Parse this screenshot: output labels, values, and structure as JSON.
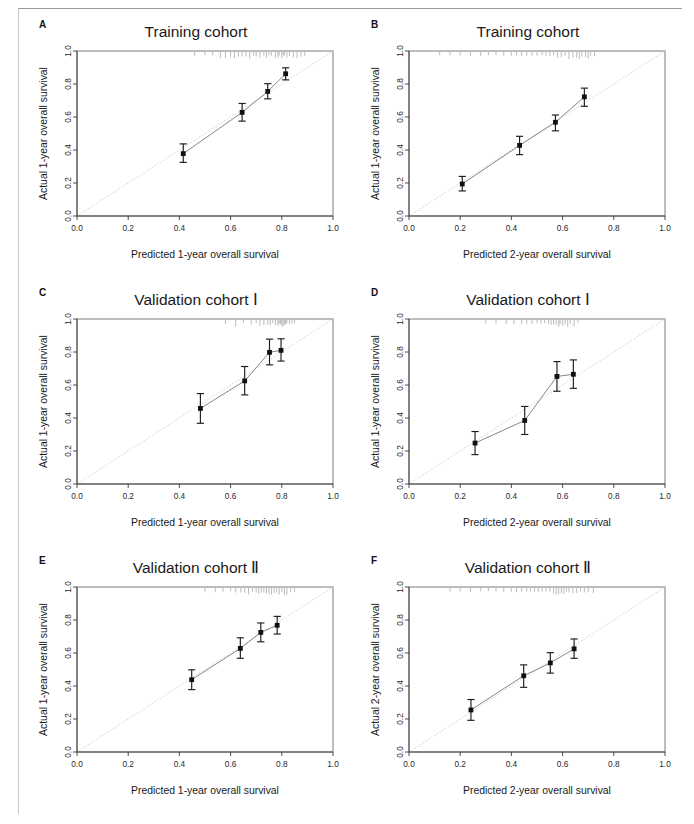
{
  "figure": {
    "panel_count": 6,
    "axis_tick_labels": [
      "0.0",
      "0.2",
      "0.4",
      "0.6",
      "0.8",
      "1.0"
    ],
    "axis_tick_values": [
      0.0,
      0.2,
      0.4,
      0.6,
      0.8,
      1.0
    ],
    "colors": {
      "background": "#ffffff",
      "point": "#101010",
      "error_bar": "#1c1c1c",
      "calibration_line": "#707070",
      "diagonal_reference": "#c4c4c4",
      "axis": "#3a3a3a",
      "box": "#6d6d6d",
      "rug": "#8c8c8c"
    }
  },
  "chart_data": [
    {
      "panel": "A",
      "type": "scatter",
      "title": "Training cohort",
      "xlabel": "Predicted 1-year overall survival",
      "ylabel": "Actual 1-year overall survival",
      "xlim": [
        0,
        1
      ],
      "ylim": [
        0,
        1
      ],
      "grid": false,
      "legend": "none",
      "reference_line": "diagonal y=x",
      "x": [
        0.415,
        0.645,
        0.745,
        0.815
      ],
      "y": [
        0.378,
        0.628,
        0.755,
        0.862
      ],
      "y_lower": [
        0.325,
        0.575,
        0.71,
        0.825
      ],
      "y_upper": [
        0.437,
        0.682,
        0.802,
        0.898
      ],
      "rug_ticks": [
        0.46,
        0.5,
        0.53,
        0.56,
        0.58,
        0.6,
        0.615,
        0.63,
        0.645,
        0.66,
        0.675,
        0.69,
        0.7,
        0.715,
        0.73,
        0.74,
        0.75,
        0.76,
        0.775,
        0.785,
        0.79,
        0.8,
        0.805,
        0.81,
        0.82,
        0.83,
        0.845,
        0.86,
        0.875,
        0.89
      ]
    },
    {
      "panel": "B",
      "type": "scatter",
      "title": "Training cohort",
      "xlabel": "Predicted 2-year overall survival",
      "ylabel": "Actual 1-year overall survival",
      "xlim": [
        0,
        1
      ],
      "ylim": [
        0,
        1
      ],
      "grid": false,
      "legend": "none",
      "reference_line": "diagonal y=x",
      "x": [
        0.208,
        0.432,
        0.572,
        0.685
      ],
      "y": [
        0.194,
        0.428,
        0.568,
        0.722
      ],
      "y_lower": [
        0.152,
        0.372,
        0.516,
        0.665
      ],
      "y_upper": [
        0.24,
        0.483,
        0.612,
        0.775
      ],
      "rug_ticks": [
        0.12,
        0.16,
        0.2,
        0.24,
        0.28,
        0.31,
        0.34,
        0.37,
        0.4,
        0.42,
        0.44,
        0.46,
        0.48,
        0.5,
        0.52,
        0.535,
        0.55,
        0.565,
        0.58,
        0.595,
        0.61,
        0.625,
        0.64,
        0.655,
        0.665,
        0.675,
        0.69,
        0.7,
        0.71,
        0.725
      ]
    },
    {
      "panel": "C",
      "type": "scatter",
      "title": "Validation cohort Ⅰ",
      "xlabel": "Predicted 1-year overall survival",
      "ylabel": "Actual 1-year overall survival",
      "xlim": [
        0,
        1
      ],
      "ylim": [
        0,
        1
      ],
      "grid": false,
      "legend": "none",
      "reference_line": "diagonal y=x",
      "x": [
        0.482,
        0.655,
        0.752,
        0.797
      ],
      "y": [
        0.458,
        0.625,
        0.798,
        0.81
      ],
      "y_lower": [
        0.368,
        0.54,
        0.722,
        0.745
      ],
      "y_upper": [
        0.548,
        0.712,
        0.878,
        0.88
      ],
      "rug_ticks": [
        0.58,
        0.62,
        0.65,
        0.68,
        0.7,
        0.715,
        0.73,
        0.745,
        0.755,
        0.765,
        0.775,
        0.785,
        0.79,
        0.795,
        0.8,
        0.805,
        0.81,
        0.815,
        0.82,
        0.83,
        0.84,
        0.85
      ]
    },
    {
      "panel": "D",
      "type": "scatter",
      "title": "Validation cohort Ⅰ",
      "xlabel": "Predicted 2-year overall survival",
      "ylabel": "Actual 1-year overall survival",
      "xlim": [
        0,
        1
      ],
      "ylim": [
        0,
        1
      ],
      "grid": false,
      "legend": "none",
      "reference_line": "diagonal y=x",
      "x": [
        0.258,
        0.452,
        0.578,
        0.642
      ],
      "y": [
        0.248,
        0.385,
        0.652,
        0.665
      ],
      "y_lower": [
        0.178,
        0.3,
        0.562,
        0.58
      ],
      "y_upper": [
        0.318,
        0.47,
        0.742,
        0.752
      ],
      "rug_ticks": [
        0.3,
        0.34,
        0.38,
        0.41,
        0.44,
        0.46,
        0.48,
        0.5,
        0.515,
        0.53,
        0.545,
        0.555,
        0.565,
        0.575,
        0.585,
        0.59,
        0.6,
        0.61,
        0.62,
        0.63,
        0.645,
        0.66
      ]
    },
    {
      "panel": "E",
      "type": "scatter",
      "title": "Validation cohort Ⅱ",
      "xlabel": "Predicted 1-year overall survival",
      "ylabel": "Actual 1-year overall survival",
      "xlim": [
        0,
        1
      ],
      "ylim": [
        0,
        1
      ],
      "grid": false,
      "legend": "none",
      "reference_line": "diagonal y=x",
      "x": [
        0.448,
        0.638,
        0.718,
        0.782
      ],
      "y": [
        0.438,
        0.628,
        0.725,
        0.768
      ],
      "y_lower": [
        0.378,
        0.568,
        0.668,
        0.715
      ],
      "y_upper": [
        0.498,
        0.692,
        0.782,
        0.822
      ],
      "rug_ticks": [
        0.5,
        0.54,
        0.57,
        0.6,
        0.62,
        0.64,
        0.655,
        0.67,
        0.685,
        0.7,
        0.71,
        0.72,
        0.73,
        0.74,
        0.75,
        0.76,
        0.77,
        0.78,
        0.79,
        0.8,
        0.81,
        0.82,
        0.835,
        0.85
      ]
    },
    {
      "panel": "F",
      "type": "scatter",
      "title": "Validation cohort Ⅱ",
      "xlabel": "Predicted 2-year overall survival",
      "ylabel": "Actual 2-year overall survival",
      "xlim": [
        0,
        1
      ],
      "ylim": [
        0,
        1
      ],
      "grid": false,
      "legend": "none",
      "reference_line": "diagonal y=x",
      "x": [
        0.242,
        0.448,
        0.552,
        0.645
      ],
      "y": [
        0.255,
        0.462,
        0.54,
        0.625
      ],
      "y_lower": [
        0.192,
        0.392,
        0.478,
        0.568
      ],
      "y_upper": [
        0.318,
        0.528,
        0.602,
        0.685
      ],
      "rug_ticks": [
        0.16,
        0.2,
        0.24,
        0.28,
        0.31,
        0.34,
        0.37,
        0.4,
        0.42,
        0.44,
        0.46,
        0.475,
        0.49,
        0.505,
        0.52,
        0.535,
        0.55,
        0.565,
        0.575,
        0.585,
        0.595,
        0.605,
        0.615,
        0.625,
        0.64,
        0.655,
        0.67,
        0.685,
        0.7,
        0.72
      ]
    }
  ]
}
